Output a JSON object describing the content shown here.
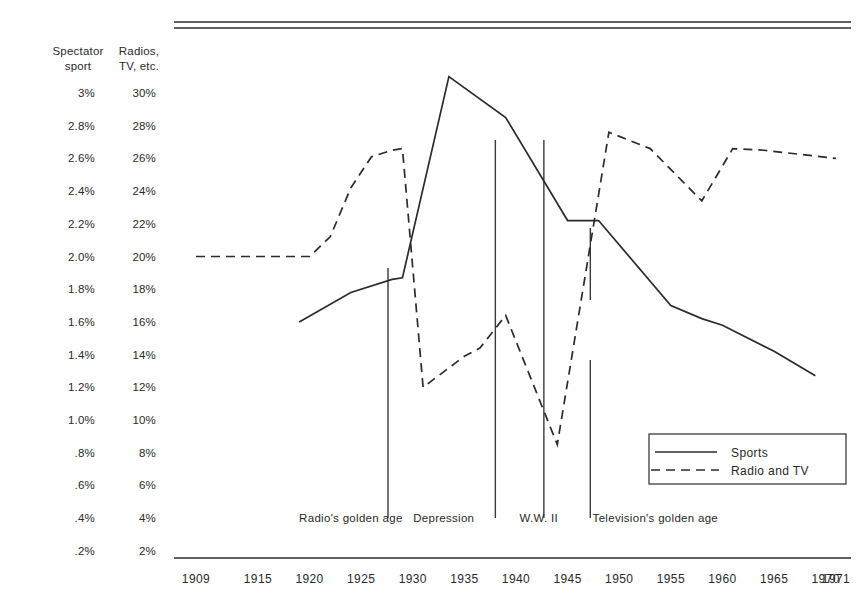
{
  "chart_data": {
    "type": "line",
    "title": "",
    "xlabel": "",
    "grid": false,
    "legend_position": "bottom-right",
    "x_tick_labels": [
      "1909",
      "1915",
      "1920",
      "1925",
      "1930",
      "1935",
      "1940",
      "1945",
      "1950",
      "1955",
      "1960",
      "1965",
      "1970",
      "1971"
    ],
    "x_tick_values": [
      1909,
      1915,
      1920,
      1925,
      1930,
      1935,
      1940,
      1945,
      1950,
      1955,
      1960,
      1965,
      1970,
      1971
    ],
    "xlim": [
      1909,
      1971
    ],
    "axes": [
      {
        "name": "spectator-sport",
        "header": "Spectator\nsport",
        "header_line1": "Spectator",
        "header_line2": "sport",
        "unit": "%",
        "tick_labels": [
          "3%",
          "2.8%",
          "2.6%",
          "2.4%",
          "2.2%",
          "2.0%",
          "1.8%",
          "1.6%",
          "1.4%",
          "1.2%",
          "1.0%",
          ".8%",
          ".6%",
          ".4%",
          ".2%"
        ],
        "tick_values": [
          3.0,
          2.8,
          2.6,
          2.4,
          2.2,
          2.0,
          1.8,
          1.6,
          1.4,
          1.2,
          1.0,
          0.8,
          0.6,
          0.4,
          0.2
        ],
        "ylim": [
          0.0,
          3.2
        ]
      },
      {
        "name": "radios-tv-etc",
        "header_line1": "Radios,",
        "header_line2": "TV, etc.",
        "unit": "%",
        "tick_labels": [
          "30%",
          "28%",
          "26%",
          "24%",
          "22%",
          "20%",
          "18%",
          "16%",
          "14%",
          "12%",
          "10%",
          "8%",
          "6%",
          "4%",
          "2%"
        ],
        "tick_values": [
          30,
          28,
          26,
          24,
          22,
          20,
          18,
          16,
          14,
          12,
          10,
          8,
          6,
          4,
          2
        ],
        "ylim": [
          0,
          32
        ]
      }
    ],
    "series": [
      {
        "name": "Sports",
        "legend_label": "Sports",
        "style": "solid",
        "axis": "spectator-sport",
        "unit": "% of consumer spending",
        "points": [
          {
            "x": 1919,
            "y": 1.6
          },
          {
            "x": 1924,
            "y": 1.78
          },
          {
            "x": 1928,
            "y": 1.86
          },
          {
            "x": 1929,
            "y": 1.87
          },
          {
            "x": 1933.5,
            "y": 3.1
          },
          {
            "x": 1939,
            "y": 2.85
          },
          {
            "x": 1945,
            "y": 2.22
          },
          {
            "x": 1948,
            "y": 2.22
          },
          {
            "x": 1955,
            "y": 1.7
          },
          {
            "x": 1958,
            "y": 1.62
          },
          {
            "x": 1960,
            "y": 1.58
          },
          {
            "x": 1965,
            "y": 1.42
          },
          {
            "x": 1969,
            "y": 1.27
          }
        ]
      },
      {
        "name": "Radio and TV",
        "legend_label": "Radio and TV",
        "style": "dashed",
        "axis": "radios-tv-etc",
        "unit": "% of consumer spending",
        "points": [
          {
            "x": 1909,
            "y": 20.0
          },
          {
            "x": 1920,
            "y": 20.0
          },
          {
            "x": 1922,
            "y": 21.2
          },
          {
            "x": 1924,
            "y": 24.2
          },
          {
            "x": 1926,
            "y": 26.1
          },
          {
            "x": 1928,
            "y": 26.5
          },
          {
            "x": 1929,
            "y": 26.6
          },
          {
            "x": 1931,
            "y": 12.0
          },
          {
            "x": 1935,
            "y": 13.9
          },
          {
            "x": 1936.5,
            "y": 14.4
          },
          {
            "x": 1939,
            "y": 16.4
          },
          {
            "x": 1944,
            "y": 8.5
          },
          {
            "x": 1949,
            "y": 27.6
          },
          {
            "x": 1953,
            "y": 26.6
          },
          {
            "x": 1958,
            "y": 23.4
          },
          {
            "x": 1961,
            "y": 26.6
          },
          {
            "x": 1964,
            "y": 26.5
          },
          {
            "x": 1971,
            "y": 26.0
          }
        ]
      }
    ],
    "era_annotations": [
      {
        "label": "Radio's golden age",
        "center_x": 1924.0
      },
      {
        "label": "Depression",
        "center_x": 1933.0
      },
      {
        "label": "W.W. II",
        "center_x": 1942.2
      },
      {
        "label": "Television's golden age",
        "center_x": 1953.5
      }
    ],
    "era_dividers": [
      {
        "x": 1927.6,
        "top_y_px": 268,
        "segments": [
          [
            268,
            518
          ]
        ]
      },
      {
        "x": 1938.0,
        "top_y_px": 140,
        "segments": [
          [
            140,
            518
          ]
        ]
      },
      {
        "x": 1942.7,
        "top_y_px": 140,
        "segments": [
          [
            140,
            518
          ]
        ]
      },
      {
        "x": 1947.2,
        "top_y_px": 228,
        "segments": [
          [
            228,
            300
          ],
          [
            360,
            518
          ]
        ]
      }
    ]
  },
  "legend": {
    "entries": [
      {
        "label": "Sports",
        "style": "solid"
      },
      {
        "label": "Radio and TV",
        "style": "dashed"
      }
    ]
  }
}
